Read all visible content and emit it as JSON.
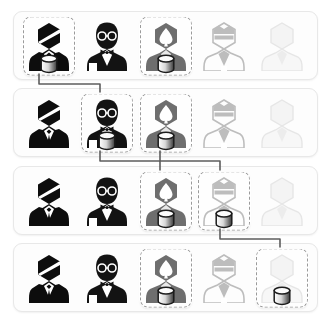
{
  "view": {
    "title": "Avatar Selection Flow",
    "background_color": "#ffffff",
    "panel_border_color": "#e8e8e8",
    "selection_border_color": "#9a9a9a",
    "connector_color": "#5d5d5d",
    "row_count": 4,
    "column_count": 5
  },
  "avatar_types": [
    {
      "id": "dark-suit",
      "label": "Dark Suit Person",
      "color": "#111111"
    },
    {
      "id": "glasses-bowtie",
      "label": "Glasses Bow Tie Person",
      "color": "#1a1a1a"
    },
    {
      "id": "spade-head",
      "label": "Spade Head Person",
      "color": "#6e6e6e"
    },
    {
      "id": "visor-crown",
      "label": "Visor Crown Person",
      "color": "#b9b9b9"
    },
    {
      "id": "blank-faint",
      "label": "Blank Faint Person",
      "color": "#ececec"
    }
  ],
  "badge": {
    "id": "database-icon",
    "label": "Database"
  },
  "rows": [
    {
      "index": 1,
      "name": "row-1",
      "cells": [
        {
          "col": 1,
          "avatar": "dark-suit",
          "selected": true,
          "badge": true
        },
        {
          "col": 2,
          "avatar": "glasses-bowtie",
          "selected": false,
          "badge": false
        },
        {
          "col": 3,
          "avatar": "spade-head",
          "selected": true,
          "badge": true
        },
        {
          "col": 4,
          "avatar": "visor-crown",
          "selected": false,
          "badge": false
        },
        {
          "col": 5,
          "avatar": "blank-faint",
          "selected": false,
          "badge": false
        }
      ]
    },
    {
      "index": 2,
      "name": "row-2",
      "cells": [
        {
          "col": 1,
          "avatar": "dark-suit",
          "selected": false,
          "badge": false
        },
        {
          "col": 2,
          "avatar": "glasses-bowtie",
          "selected": true,
          "badge": true
        },
        {
          "col": 3,
          "avatar": "spade-head",
          "selected": true,
          "badge": true
        },
        {
          "col": 4,
          "avatar": "visor-crown",
          "selected": false,
          "badge": false
        },
        {
          "col": 5,
          "avatar": "blank-faint",
          "selected": false,
          "badge": false
        }
      ]
    },
    {
      "index": 3,
      "name": "row-3",
      "cells": [
        {
          "col": 1,
          "avatar": "dark-suit",
          "selected": false,
          "badge": false
        },
        {
          "col": 2,
          "avatar": "glasses-bowtie",
          "selected": false,
          "badge": false
        },
        {
          "col": 3,
          "avatar": "spade-head",
          "selected": true,
          "badge": true
        },
        {
          "col": 4,
          "avatar": "visor-crown",
          "selected": true,
          "badge": true
        },
        {
          "col": 5,
          "avatar": "blank-faint",
          "selected": false,
          "badge": false
        }
      ]
    },
    {
      "index": 4,
      "name": "row-4",
      "cells": [
        {
          "col": 1,
          "avatar": "dark-suit",
          "selected": false,
          "badge": false
        },
        {
          "col": 2,
          "avatar": "glasses-bowtie",
          "selected": false,
          "badge": false
        },
        {
          "col": 3,
          "avatar": "spade-head",
          "selected": true,
          "badge": true
        },
        {
          "col": 4,
          "avatar": "visor-crown",
          "selected": false,
          "badge": false
        },
        {
          "col": 5,
          "avatar": "blank-faint",
          "selected": true,
          "badge": true
        }
      ]
    }
  ],
  "connectors": [
    {
      "id": "c1",
      "label": "row1-col1 to row2-col2",
      "path": "M 39 74 L 39 84 L 100 84 L 100 92"
    },
    {
      "id": "c2",
      "label": "row2-col2 to row3-col3",
      "path": "M 100 151 L 100 161 L 160 161 L 160 170"
    },
    {
      "id": "c3",
      "label": "row2-col3 to row3-col4",
      "path": "M 160 151 L 160 161 L 220 161 L 220 170"
    },
    {
      "id": "c4",
      "label": "row3-col4 to row4-col5",
      "path": "M 220 229 L 220 239 L 280 239 L 280 247"
    }
  ]
}
